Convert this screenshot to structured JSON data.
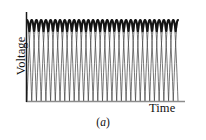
{
  "figure": {
    "caption_prefix": "(",
    "caption_letter": "a",
    "caption_suffix": ")",
    "caption_full": "(a)"
  },
  "axes": {
    "y_label": "Voltage",
    "x_label": "Time",
    "y_axis_color": "#1a1a1a",
    "x_axis_color": "#8c8c8c"
  },
  "chart_data": {
    "type": "line",
    "title": "",
    "subtitle": "",
    "xlabel": "Time",
    "ylabel": "Voltage",
    "xlim": [
      0,
      16
    ],
    "ylim": [
      0,
      1
    ],
    "grid": false,
    "legend": "none",
    "annotations": [
      "(a)"
    ],
    "n_cycles": 16,
    "envelope": {
      "name": "output-envelope",
      "color": "#141414",
      "line_width": 2.1,
      "ripple_min": 0.86,
      "ripple_max": 1.0,
      "scallop_count": 16
    },
    "series": [
      {
        "name": "phase-waveforms",
        "color": "#4a4a4a",
        "line_width": 0.75,
        "count": 16,
        "shape": "rectified-sine",
        "peak": 1.0,
        "trough": 0.0,
        "phase_step": 0.5
      }
    ],
    "x_tick_labels": [],
    "y_tick_labels": []
  }
}
